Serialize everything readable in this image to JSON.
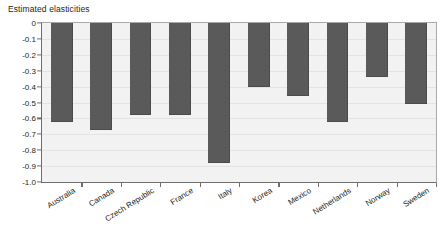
{
  "chart_data": {
    "type": "bar",
    "title": "Estimated elasticities",
    "xlabel": "",
    "ylabel": "",
    "ylim": [
      -1.0,
      0
    ],
    "grid": true,
    "legend": "none",
    "orientation": "vertical",
    "categories": [
      "Australia",
      "Canada",
      "Czech Republic",
      "France",
      "Italy",
      "Korea",
      "Mexico",
      "Netherlands",
      "Norway",
      "Sweden"
    ],
    "values": [
      -0.62,
      -0.67,
      -0.58,
      -0.58,
      -0.88,
      -0.4,
      -0.46,
      -0.62,
      -0.34,
      -0.51
    ],
    "ytick_labels": [
      "0",
      "-0.1",
      "-0.2",
      "-0.3",
      "-0.4",
      "-0.5",
      "-0.6",
      "-0.7",
      "-0.8",
      "-0.9",
      "-1.0"
    ],
    "ytick_values": [
      0,
      -0.1,
      -0.2,
      -0.3,
      -0.4,
      -0.5,
      -0.6,
      -0.7,
      -0.8,
      -0.9,
      -1.0
    ],
    "bar_color": "#5a5a5a",
    "plot_background": "#f2f2f2",
    "axis_color": "#6e6e6e",
    "text_color": "#231f20"
  }
}
